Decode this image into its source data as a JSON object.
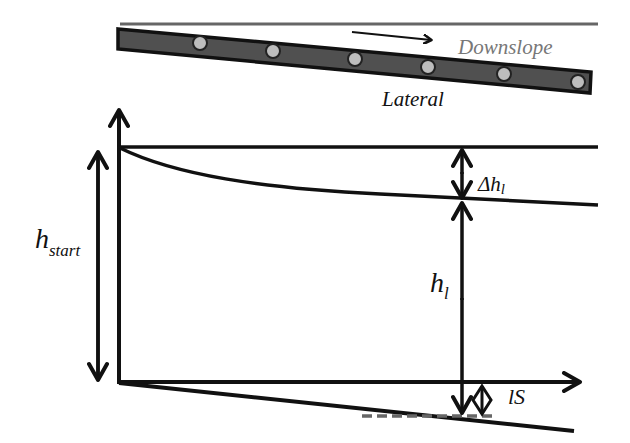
{
  "diagram": {
    "type": "lateral-pipe-pressure-head-profile",
    "labels": {
      "downslope": "Downslope",
      "lateral": "Lateral",
      "h_start_main": "h",
      "h_start_sub": "start",
      "delta_h_prefix": "Δh",
      "delta_h_sub": "l",
      "h_l_main": "h",
      "h_l_sub": "l",
      "slope_drop": "lS"
    },
    "colors": {
      "pipe_fill": "#505050",
      "pipe_border": "#111111",
      "emitter": "#bdbdbd",
      "ground_line": "#666666",
      "downslope_text": "#777777",
      "ink": "#111111",
      "dashed": "#666666"
    },
    "emitters_count": 6
  }
}
